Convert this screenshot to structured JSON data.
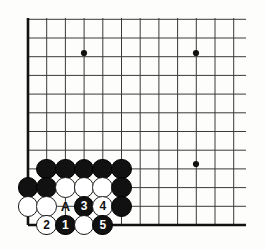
{
  "figure": {
    "kind": "go-board-diagram",
    "board_size": 19,
    "visible_corner": "bottom-left",
    "background_color": "#fdfdfc",
    "line_color": "#3a3a3a",
    "edge_color": "#111111",
    "black_color": "#111111",
    "white_color": "#ffffff",
    "label_color": "#111111"
  },
  "grid": {
    "origin_x": 28,
    "origin_y": 225,
    "spacing_x": 18.7,
    "spacing_y": 18.7,
    "columns_visible": 12,
    "rows_visible": 12,
    "left_edge_x": 28,
    "bottom_edge_y": 225,
    "line_extent_right": 246,
    "line_extent_top": 18
  },
  "star_points": [
    {
      "name": "star-point-upper-left",
      "x": 84,
      "y": 53
    },
    {
      "name": "star-point-upper-right",
      "x": 196,
      "y": 53
    },
    {
      "name": "star-point-lower-right",
      "x": 196,
      "y": 164
    }
  ],
  "stones": [
    {
      "id": "b-c2-r4",
      "color": "black",
      "label": "",
      "col": 2,
      "row": 4,
      "x": 46.7,
      "y": 168.9
    },
    {
      "id": "b-c3-r4",
      "color": "black",
      "label": "",
      "col": 3,
      "row": 4,
      "x": 65.4,
      "y": 168.9
    },
    {
      "id": "b-c4-r4",
      "color": "black",
      "label": "",
      "col": 4,
      "row": 4,
      "x": 84.1,
      "y": 168.9
    },
    {
      "id": "b-c5-r4",
      "color": "black",
      "label": "",
      "col": 5,
      "row": 4,
      "x": 102.8,
      "y": 168.9
    },
    {
      "id": "b-c6-r4",
      "color": "black",
      "label": "",
      "col": 6,
      "row": 4,
      "x": 121.5,
      "y": 168.9
    },
    {
      "id": "b-c1-r3",
      "color": "black",
      "label": "",
      "col": 1,
      "row": 3,
      "x": 28.0,
      "y": 187.6
    },
    {
      "id": "b-c2-r3",
      "color": "black",
      "label": "",
      "col": 2,
      "row": 3,
      "x": 46.7,
      "y": 187.6
    },
    {
      "id": "w-c3-r3",
      "color": "white",
      "label": "",
      "col": 3,
      "row": 3,
      "x": 65.4,
      "y": 187.6
    },
    {
      "id": "w-c4-r3",
      "color": "white",
      "label": "",
      "col": 4,
      "row": 3,
      "x": 84.1,
      "y": 187.6
    },
    {
      "id": "w-c5-r3",
      "color": "white",
      "label": "",
      "col": 5,
      "row": 3,
      "x": 102.8,
      "y": 187.6
    },
    {
      "id": "b-c6-r3",
      "color": "black",
      "label": "",
      "col": 6,
      "row": 3,
      "x": 121.5,
      "y": 187.6
    },
    {
      "id": "w-c1-r2",
      "color": "white",
      "label": "",
      "col": 1,
      "row": 2,
      "x": 28.0,
      "y": 206.3
    },
    {
      "id": "w-c2-r2",
      "color": "white",
      "label": "",
      "col": 2,
      "row": 2,
      "x": 46.7,
      "y": 206.3
    },
    {
      "id": "b-c4-r2-move3",
      "color": "black",
      "label": "3",
      "col": 4,
      "row": 2,
      "x": 84.1,
      "y": 206.3
    },
    {
      "id": "w-c5-r2-move4",
      "color": "white",
      "label": "4",
      "col": 5,
      "row": 2,
      "x": 102.8,
      "y": 206.3
    },
    {
      "id": "b-c6-r2",
      "color": "black",
      "label": "",
      "col": 6,
      "row": 2,
      "x": 121.5,
      "y": 206.3
    },
    {
      "id": "w-c2-r1-move2",
      "color": "white",
      "label": "2",
      "col": 2,
      "row": 1,
      "x": 46.7,
      "y": 225.0
    },
    {
      "id": "b-c3-r1-move1",
      "color": "black",
      "label": "1",
      "col": 3,
      "row": 1,
      "x": 65.4,
      "y": 225.0
    },
    {
      "id": "w-c4-r1",
      "color": "white",
      "label": "",
      "col": 4,
      "row": 1,
      "x": 84.1,
      "y": 225.0
    },
    {
      "id": "b-c5-r1-move5",
      "color": "black",
      "label": "5",
      "col": 5,
      "row": 1,
      "x": 102.8,
      "y": 225.0
    }
  ],
  "point_labels": [
    {
      "id": "label-a",
      "text": "A",
      "col": 3,
      "row": 2,
      "x": 65.4,
      "y": 206.3
    }
  ],
  "move_sequence": [
    {
      "number": "1",
      "color": "black"
    },
    {
      "number": "2",
      "color": "white"
    },
    {
      "number": "3",
      "color": "black"
    },
    {
      "number": "4",
      "color": "white"
    },
    {
      "number": "5",
      "color": "black"
    }
  ],
  "stone_radius": 10.4
}
